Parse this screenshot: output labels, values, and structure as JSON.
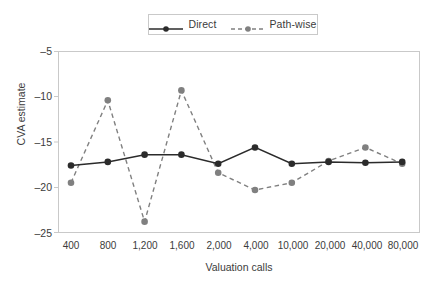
{
  "chart_data": {
    "type": "line",
    "title": "",
    "xlabel": "Valuation calls",
    "ylabel": "CVA estimate",
    "categories": [
      "400",
      "800",
      "1,200",
      "1,600",
      "2,000",
      "4,000",
      "10,000",
      "20,000",
      "40,000",
      "80,000"
    ],
    "ylim": [
      -25,
      -5
    ],
    "yticks": [
      -5,
      -10,
      -15,
      -20,
      -25
    ],
    "ytick_labels": [
      "–5",
      "–10",
      "–15",
      "–20",
      "–25"
    ],
    "grid": false,
    "legend_position": "top-center",
    "series": [
      {
        "name": "Direct",
        "color": "#2b2b2b",
        "line_style": "solid",
        "marker": "circle-filled",
        "values": [
          -17.6,
          -17.2,
          -16.4,
          -16.4,
          -17.4,
          -15.6,
          -17.4,
          -17.2,
          -17.3,
          -17.2
        ]
      },
      {
        "name": "Path-wise",
        "color": "#808080",
        "line_style": "dashed",
        "marker": "circle-filled",
        "values": [
          -19.5,
          -10.4,
          -23.8,
          -9.3,
          -18.4,
          -20.3,
          -19.5,
          -17.1,
          -15.6,
          -17.4
        ]
      }
    ]
  },
  "legend": {
    "items": [
      {
        "label": "Direct"
      },
      {
        "label": "Path-wise"
      }
    ]
  },
  "colors": {
    "direct": "#2b2b2b",
    "pathwise": "#808080",
    "frame": "#c9c9c9",
    "text": "#3b3b3b",
    "background": "#ffffff"
  }
}
